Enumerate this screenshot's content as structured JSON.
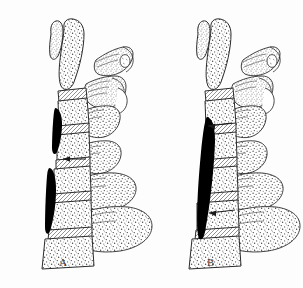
{
  "figure": {
    "background_color": "#fdfdfd",
    "ink_color": "#2b2b2b",
    "shade_color": "#000000",
    "stipple_color": "#555555",
    "width": 303,
    "height": 288
  },
  "panels": [
    {
      "id": "A",
      "label": "A",
      "label_x": 59,
      "label_y": 256,
      "description": "Lateral view of cervicothoracic spine with two separate dark ossified bands along the posterior vertebral body margin",
      "vertebral_bodies": 7,
      "dark_segments": [
        {
          "name": "upper-ossified-band",
          "top": 108,
          "bottom": 152,
          "x": 54,
          "width": 7
        },
        {
          "name": "lower-ossified-band",
          "top": 168,
          "bottom": 232,
          "x": 46,
          "width": 8
        }
      ],
      "arrows": [
        {
          "name": "arrow-upper",
          "tip_x": 60,
          "tip_y": 159,
          "tail_x": 86,
          "tail_y": 159
        }
      ],
      "posterior_elements": 5
    },
    {
      "id": "B",
      "label": "B",
      "label_x": 207,
      "label_y": 256,
      "description": "Lateral view of cervicothoracic spine with one continuous dark ossified band bridging multiple levels",
      "vertebral_bodies": 7,
      "dark_segments": [
        {
          "name": "continuous-ossified-band",
          "top": 118,
          "bottom": 242,
          "x": 199,
          "width": 9
        }
      ],
      "arrows": [
        {
          "name": "arrow-upper",
          "tip_x": 205,
          "tip_y": 126,
          "tail_x": 231,
          "tail_y": 123
        },
        {
          "name": "arrow-lower",
          "tip_x": 206,
          "tip_y": 213,
          "tail_x": 234,
          "tail_y": 210
        }
      ],
      "posterior_elements": 5
    }
  ]
}
